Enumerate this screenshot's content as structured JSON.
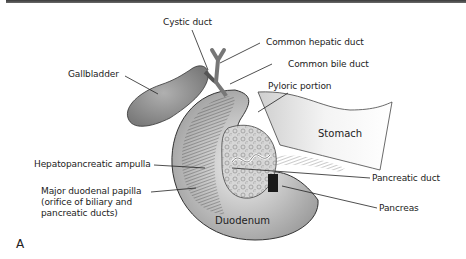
{
  "figure": {
    "panel_letter": "A",
    "labels": {
      "cystic_duct": "Cystic duct",
      "common_hepatic_duct": "Common hepatic duct",
      "common_bile_duct": "Common bile duct",
      "gallbladder": "Gallbladder",
      "pyloric_portion": "Pyloric portion",
      "stomach": "Stomach",
      "hepatopancreatic_ampulla": "Hepatopancreatic ampulla",
      "major_duodenal_papilla_line1": "Major duodenal papilla",
      "major_duodenal_papilla_line2": "(orifice of biliary and",
      "major_duodenal_papilla_line3": "pancreatic ducts)",
      "pancreatic_duct": "Pancreatic duct",
      "pancreas": "Pancreas",
      "duodenum": "Duodenum"
    },
    "colors": {
      "gallbladder_fill": "#9a9a9a",
      "duodenum_fill": "#d8d8d8",
      "stomach_fill": "#eeeeee",
      "pancreas_fill": "#cfcfcf",
      "line": "#222222",
      "top_bar": "#444444"
    }
  }
}
